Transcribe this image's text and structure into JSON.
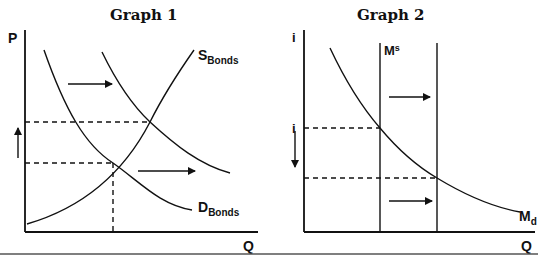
{
  "graphs": [
    {
      "title": "Graph 1",
      "y_axis_label": "P",
      "x_axis_label": "Q",
      "supply_label": {
        "main": "S",
        "sub": "Bonds"
      },
      "demand_label": {
        "main": "D",
        "sub": "Bonds"
      },
      "annotations": [
        "demand shifts right",
        "price rises"
      ]
    },
    {
      "title": "Graph 2",
      "y_axis_label_top": "i",
      "y_axis_label_mid": "i",
      "x_axis_label": "Q",
      "supply_label": {
        "main": "M",
        "sup": "s"
      },
      "demand_label": {
        "main": "M",
        "sub": "d"
      },
      "annotations": [
        "money supply shifts right",
        "interest rate falls"
      ]
    }
  ],
  "colors": {
    "line": "#111111",
    "background": "#ffffff",
    "rule": "#555555"
  }
}
